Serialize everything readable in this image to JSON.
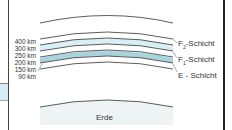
{
  "diagram": {
    "altitude_labels": [
      "400 km",
      "300 km",
      "250 km",
      "200 km",
      "150 km",
      "90 km"
    ],
    "layers": [
      {
        "prefix": "F",
        "sub": "2",
        "suffix": "-Schicht"
      },
      {
        "prefix": "F",
        "sub": "1",
        "suffix": "-Schicht"
      },
      {
        "prefix": "E",
        "sub": "",
        "suffix": " - Schicht"
      }
    ],
    "earth_label": "Erde",
    "colors": {
      "line": "#333333",
      "band_light": "#d8eff4",
      "band_mid": "#a9d3df",
      "earth_glow": "#eef3f4"
    }
  }
}
